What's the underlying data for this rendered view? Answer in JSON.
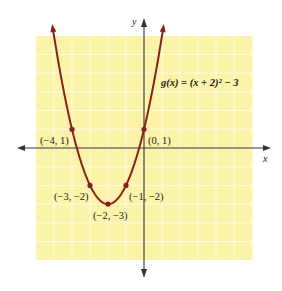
{
  "chart_data": {
    "type": "line",
    "title": "",
    "function_label": "g(x) = (x + 2)² − 3",
    "xlabel": "x",
    "ylabel": "y",
    "xlim": [
      -6,
      6
    ],
    "ylim": [
      -6,
      6
    ],
    "grid": true,
    "series": [
      {
        "name": "g(x) = (x + 2)^2 - 3",
        "x": [
          -4,
          -3,
          -2,
          -1,
          0
        ],
        "y": [
          1,
          -2,
          -3,
          -2,
          1
        ]
      }
    ],
    "points": [
      {
        "x": -4,
        "y": 1,
        "label": "(−4, 1)"
      },
      {
        "x": -3,
        "y": -2,
        "label": "(−3, −2)"
      },
      {
        "x": -2,
        "y": -3,
        "label": "(−2, −3)"
      },
      {
        "x": -1,
        "y": -2,
        "label": "(−1, −2)"
      },
      {
        "x": 0,
        "y": 1,
        "label": "(0, 1)"
      }
    ]
  },
  "labels": {
    "x_axis": "x",
    "y_axis": "y",
    "equation": "g(x) = (x + 2)² − 3",
    "p1": "(−4, 1)",
    "p2": "(−3, −2)",
    "p3": "(−2, −3)",
    "p4": "(−1, −2)",
    "p5": "(0, 1)"
  },
  "colors": {
    "background": "#ffffff",
    "grid_fill": "#fbf3a8",
    "grid_line": "#fffbe0",
    "curve": "#8b1f1a",
    "axis": "#333333"
  }
}
